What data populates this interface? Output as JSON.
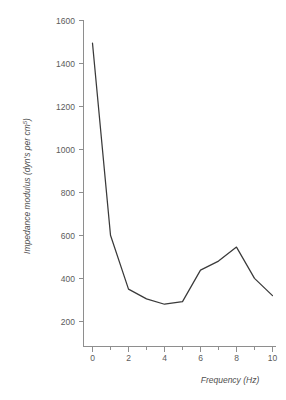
{
  "chart_data": {
    "type": "line",
    "title": "",
    "subtitle": "",
    "xlabel": "Frequency (Hz)",
    "ylabel": "Impedance modulus (dyn·s per cm⁵)",
    "ylabel_main": "Impedance modulus (dyn's per cm",
    "ylabel_sup": "5",
    "ylabel_tail": ")",
    "x": [
      0,
      1,
      2,
      3,
      4,
      5,
      6,
      7,
      8,
      9,
      10
    ],
    "values": [
      1490,
      600,
      350,
      305,
      280,
      292,
      438,
      480,
      545,
      400,
      320
    ],
    "series": [
      {
        "name": "Impedance modulus",
        "values": [
          1490,
          600,
          350,
          305,
          280,
          292,
          438,
          480,
          545,
          400,
          320
        ]
      }
    ],
    "xlim": [
      -0.55,
      10.55
    ],
    "ylim": [
      120,
      1640
    ],
    "xticks": [
      0,
      2,
      4,
      6,
      8,
      10
    ],
    "xticklabels": [
      "0",
      "2",
      "4",
      "6",
      "8",
      "10"
    ],
    "xminorticks": [
      1,
      3,
      5,
      7,
      9
    ],
    "yticks": [
      200,
      400,
      600,
      800,
      1000,
      1200,
      1400,
      1600
    ],
    "yticklabels": [
      "200",
      "400",
      "600",
      "800",
      "1000",
      "1200",
      "1400",
      "1600"
    ],
    "grid": false,
    "legend": "none",
    "line_color": "#3a3a3a",
    "axis_color": "#8e8e8e",
    "background_color": "#ffffff"
  }
}
